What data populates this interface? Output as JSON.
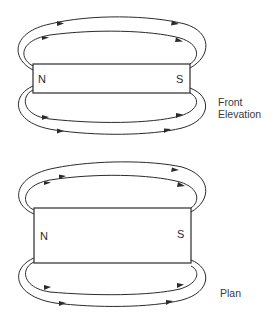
{
  "diagram": {
    "views": [
      {
        "id": "front-elevation",
        "caption_lines": [
          "Front",
          "Elevation"
        ],
        "magnet": {
          "north_label": "N",
          "south_label": "S"
        },
        "field_lines": {
          "above": 2,
          "below": 2,
          "direction": "N to S"
        }
      },
      {
        "id": "plan",
        "caption_lines": [
          "Plan"
        ],
        "magnet": {
          "north_label": "N",
          "south_label": "S"
        },
        "field_lines": {
          "above": 2,
          "below": 2,
          "direction": "N to S"
        }
      }
    ]
  }
}
